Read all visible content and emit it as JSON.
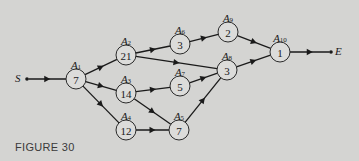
{
  "caption": "FIGURE 30",
  "start": {
    "label": "S",
    "x": 27,
    "y": 79
  },
  "end": {
    "label": "E",
    "x": 331,
    "y": 52
  },
  "nodes": [
    {
      "id": "A1",
      "value": "7",
      "x": 76,
      "y": 79
    },
    {
      "id": "A2",
      "value": "21",
      "x": 126,
      "y": 55
    },
    {
      "id": "A3",
      "value": "14",
      "x": 126,
      "y": 93
    },
    {
      "id": "A4",
      "value": "12",
      "x": 126,
      "y": 130
    },
    {
      "id": "A5",
      "value": "7",
      "x": 179,
      "y": 130
    },
    {
      "id": "A6",
      "value": "3",
      "x": 180,
      "y": 44
    },
    {
      "id": "A7",
      "value": "5",
      "x": 180,
      "y": 86
    },
    {
      "id": "A8",
      "value": "3",
      "x": 227,
      "y": 70
    },
    {
      "id": "A9",
      "value": "2",
      "x": 228,
      "y": 32
    },
    {
      "id": "A10",
      "value": "1",
      "x": 280,
      "y": 52
    }
  ],
  "edges": [
    [
      "S",
      "A1"
    ],
    [
      "A1",
      "A2"
    ],
    [
      "A1",
      "A3"
    ],
    [
      "A1",
      "A4"
    ],
    [
      "A2",
      "A6"
    ],
    [
      "A2",
      "A8"
    ],
    [
      "A3",
      "A7"
    ],
    [
      "A3",
      "A5"
    ],
    [
      "A4",
      "A5"
    ],
    [
      "A6",
      "A9"
    ],
    [
      "A7",
      "A8"
    ],
    [
      "A5",
      "A8"
    ],
    [
      "A9",
      "A10"
    ],
    [
      "A8",
      "A10"
    ],
    [
      "A10",
      "E"
    ]
  ]
}
